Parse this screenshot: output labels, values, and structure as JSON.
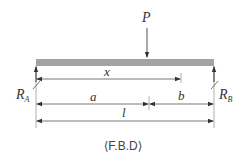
{
  "diagram": {
    "type": "free-body-diagram",
    "caption": "⟨F.B.D⟩",
    "beam": {
      "color": "#a3a3a3",
      "x_start": 36,
      "x_end": 214,
      "y_top": 59,
      "height": 7
    },
    "load": {
      "label": "P",
      "x": 147
    },
    "reactions": {
      "left": {
        "label": "R",
        "subscript": "A"
      },
      "right": {
        "label": "R",
        "subscript": "B"
      }
    },
    "dimensions": {
      "x": "x",
      "a": "a",
      "b": "b",
      "l": "l"
    },
    "line_color": "#555555"
  }
}
